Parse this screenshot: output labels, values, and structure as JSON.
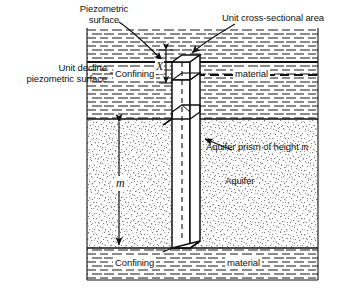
{
  "figure": {
    "width": 341,
    "height": 292,
    "background_color": "#ffffff",
    "line_color": "#111111"
  },
  "labels": {
    "piezometric_surface_line1": "Piezometric",
    "piezometric_surface_line2": "surface",
    "unit_cross_sectional_area": "Unit cross-sectional area",
    "unit_decline_line1": "Unit decline",
    "unit_decline_line2": "piezometric surface",
    "confining_upper_left": "Confining",
    "confining_upper_right": "material",
    "confining_lower_left": "Confining",
    "confining_lower_right": "material",
    "aquifer": "Aquifer",
    "aquifer_prism_prefix": "Aquifer prism of height ",
    "aquifer_prism_symbol": "m",
    "dim_x": "X",
    "dim_m": "m"
  },
  "geometry": {
    "frame_left": 87,
    "frame_right": 318,
    "frame_top": 28,
    "frame_bottom": 280,
    "confining_top_band": [
      28,
      119
    ],
    "aquifer_band": [
      119,
      248
    ],
    "confining_bottom_band": [
      248,
      280
    ],
    "prism_left": 172,
    "prism_right": 196,
    "prism_top": 55,
    "prism_bottom": 248
  },
  "colors": {
    "ink": "#111111",
    "aquifer_stipple": "#9a9a9a",
    "confining_dash": "#333333",
    "prism_fill": "#ffffff"
  },
  "annotations": {
    "piezometric_arrow_from": [
      120,
      22
    ],
    "piezometric_arrow_to": [
      168,
      63
    ],
    "unit_cross_arrow_from": [
      232,
      24
    ],
    "unit_cross_arrow_to": [
      190,
      55
    ],
    "unit_decline_arrow_from": [
      110,
      74
    ],
    "unit_decline_arrow_to": [
      168,
      74
    ],
    "aquifer_prism_arrow_from": [
      206,
      150
    ],
    "aquifer_prism_arrow_to": [
      196,
      135
    ]
  }
}
